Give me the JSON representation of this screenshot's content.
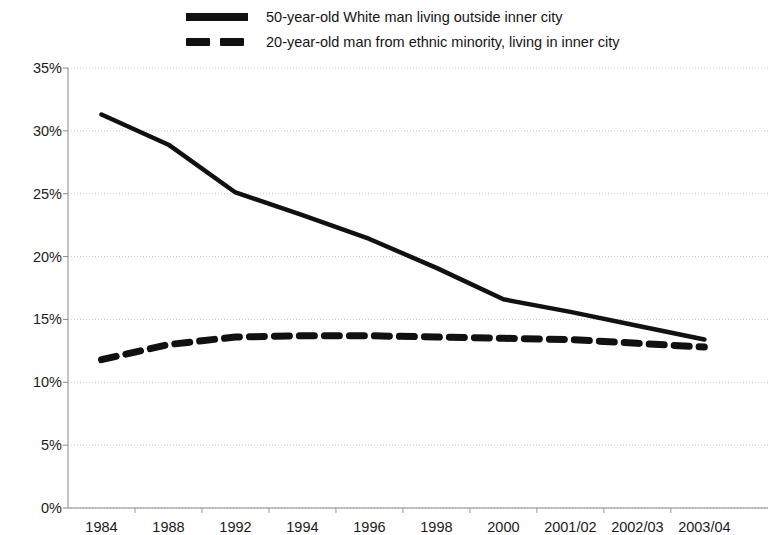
{
  "legend": {
    "entries": [
      {
        "style": "solid",
        "label": "50-year-old White man living outside inner city"
      },
      {
        "style": "dashed",
        "label": "20-year-old man from ethnic minority, living in inner city"
      }
    ]
  },
  "chart_data": {
    "type": "line",
    "title": "",
    "xlabel": "",
    "ylabel": "",
    "ylim": [
      0,
      35
    ],
    "ytick_labels": [
      "0%",
      "5%",
      "10%",
      "15%",
      "20%",
      "25%",
      "30%",
      "35%"
    ],
    "ytick_values": [
      0,
      5,
      10,
      15,
      20,
      25,
      30,
      35
    ],
    "grid": true,
    "legend_position": "top",
    "categories": [
      "1984",
      "1988",
      "1992",
      "1994",
      "1996",
      "1998",
      "2000",
      "2001/02",
      "2002/03",
      "2003/04"
    ],
    "series": [
      {
        "name": "50-year-old White man living outside inner city",
        "style": "solid",
        "color": "#111111",
        "values": [
          31.3,
          28.9,
          25.1,
          23.3,
          21.4,
          19.1,
          16.6,
          15.6,
          14.5,
          13.4
        ]
      },
      {
        "name": "20-year-old man from ethnic minority, living in inner city",
        "style": "dashed",
        "color": "#111111",
        "values": [
          11.8,
          13.0,
          13.6,
          13.7,
          13.7,
          13.6,
          13.5,
          13.4,
          13.1,
          12.8
        ]
      }
    ]
  },
  "axes": {
    "y_gridline_color": "#c9c9c9",
    "axis_color": "#808080"
  }
}
